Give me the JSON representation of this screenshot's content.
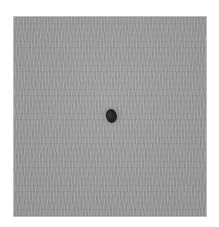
{
  "image": {
    "description": "Grayscale textured fibrous surface with a small dark spot near the center",
    "background_color": "#ffffff",
    "surface_color": "#9a9a9a",
    "spot_color": "#1c1c1c"
  }
}
